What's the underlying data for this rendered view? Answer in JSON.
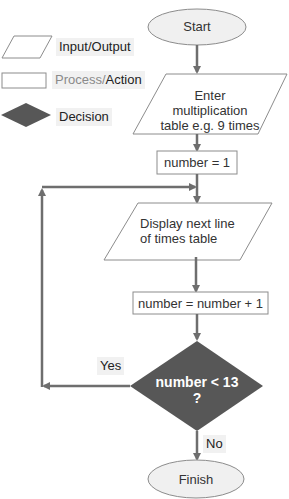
{
  "legend": {
    "input_output": "Input/Output",
    "process_part1": "Process/",
    "process_part2": "Action",
    "decision": "Decision"
  },
  "nodes": {
    "start": "Start",
    "input": "Enter multiplication table e.g. 9 times",
    "init": "number = 1",
    "display": "Display next line of times table",
    "increment": "number = number + 1",
    "decision_line1": "number < 13",
    "decision_line2": "?",
    "finish": "Finish"
  },
  "edges": {
    "yes_label": "Yes",
    "no_label": "No"
  },
  "colors": {
    "line": "#6e6e6e",
    "decision_fill": "#575757",
    "terminal_fill": "#f0f0f0",
    "shape_stroke": "#8c8c8c"
  }
}
